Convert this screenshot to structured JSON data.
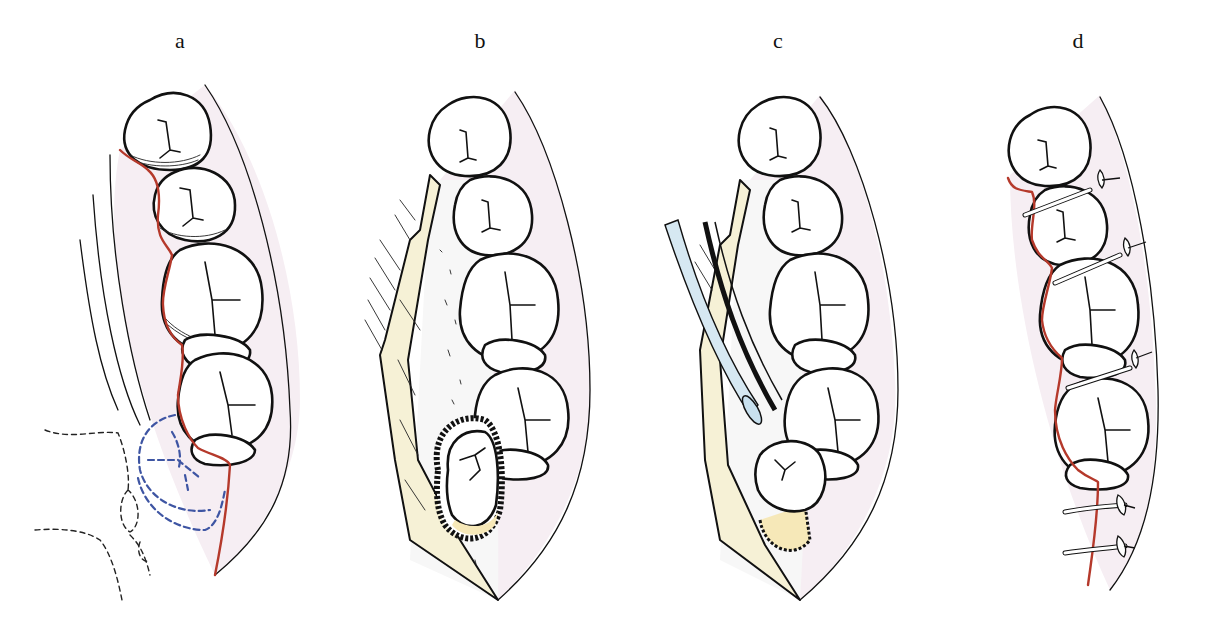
{
  "figure": {
    "panels": [
      {
        "id": "a",
        "label": "a",
        "description": "Dental arch with red incision line along gingiva and blue dashed outline of impacted third molar"
      },
      {
        "id": "b",
        "label": "b",
        "description": "Flap reflected exposing bone and impacted molar with bone removal around crown"
      },
      {
        "id": "c",
        "label": "c",
        "description": "Elevator instrument luxating the exposed molar out of its socket"
      },
      {
        "id": "d",
        "label": "d",
        "description": "Flap repositioned and closed with interrupted sutures"
      }
    ],
    "colors": {
      "incision": "#b5392b",
      "impacted_outline": "#3e55a3",
      "flap": "#f6f1d6",
      "mucosa": "#f6eef3",
      "instrument": "#d6e8f2",
      "ink": "#111111"
    }
  }
}
